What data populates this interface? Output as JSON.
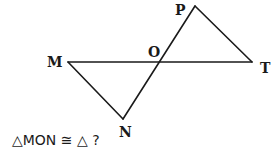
{
  "diagram": {
    "type": "geometry",
    "stroke_color": "#1a1a1a",
    "points": {
      "M": {
        "label": "M",
        "x": 68,
        "y": 62
      },
      "O": {
        "label": "O",
        "x": 160,
        "y": 62
      },
      "T": {
        "label": "T",
        "x": 252,
        "y": 62
      },
      "P": {
        "label": "P",
        "x": 195,
        "y": 6
      },
      "N": {
        "label": "N",
        "x": 123,
        "y": 119
      }
    },
    "segments": [
      [
        "M",
        "T"
      ],
      [
        "P",
        "N"
      ],
      [
        "M",
        "N"
      ],
      [
        "P",
        "T"
      ]
    ],
    "triangles": [
      "MON",
      "TOP"
    ]
  },
  "question": {
    "text": "△MON ≅ △ ?"
  }
}
